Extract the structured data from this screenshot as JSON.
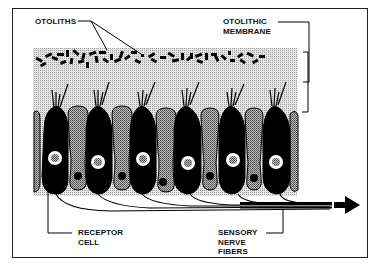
{
  "diagram": {
    "type": "anatomical-schematic",
    "labels": {
      "otoliths": "OTOLITHS",
      "otolithic_membrane": "OTOLITHIC\nMEMBRANE",
      "receptor_cell": "RECEPTOR\nCELL",
      "sensory_nerve_fibers": "SENSORY\nNERVE\nFIBERS"
    },
    "elements": {
      "receptor_cells": {
        "count": 6,
        "fill": "#000000",
        "description": "black hair cells with stereocilia bundles and light nucleus"
      },
      "supporting_cells": {
        "count": 7,
        "fill": "#9a9a9a",
        "description": "stippled gray supporting cells with small dark nucleus"
      },
      "membrane": {
        "fill": "#d4d4d4",
        "description": "stippled gelatinous otolithic membrane"
      },
      "otoliths": {
        "fill": "#000000",
        "description": "scattered small dash-shaped crystals"
      },
      "nerve_bundle": {
        "direction": "right",
        "arrow": true
      }
    },
    "colors": {
      "ink": "#111111",
      "membrane": "#d4d4d4",
      "supporting_cell": "#9a9a9a",
      "background": "#ffffff"
    }
  }
}
